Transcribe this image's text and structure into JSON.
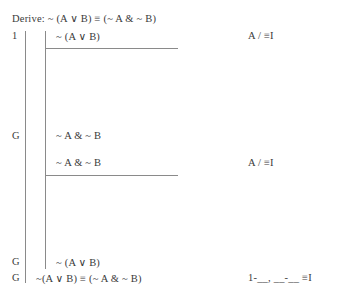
{
  "header": {
    "label": "Derive:",
    "goal_formula": "~ (A ∨ B) ≡ (~ A & ~ B)",
    "full_text": "Derive: ~ (A ∨ B) ≡ (~ A & ~ B)"
  },
  "proof": {
    "lines": [
      {
        "label": "1",
        "formula": "~ (A ∨ B)",
        "justification": "A / ≡I",
        "role": "assumption-subproof-1"
      },
      {
        "label": "G",
        "formula": "~ A & ~ B",
        "justification": "",
        "role": "goal-subproof-1"
      },
      {
        "label": "",
        "formula": "~ A & ~ B",
        "justification": "A / ≡I",
        "role": "assumption-subproof-2"
      },
      {
        "label": "G",
        "formula": "~ (A ∨ B)",
        "justification": "",
        "role": "goal-subproof-2"
      },
      {
        "label": "G",
        "formula": "~(A ∨ B) ≡ (~ A & ~ B)",
        "justification": "1-__, __-__  ≡I",
        "role": "conclusion"
      }
    ]
  },
  "colors": {
    "ink": "#3a3a3a",
    "rule": "#8a8a8a",
    "background": "#ffffff"
  }
}
